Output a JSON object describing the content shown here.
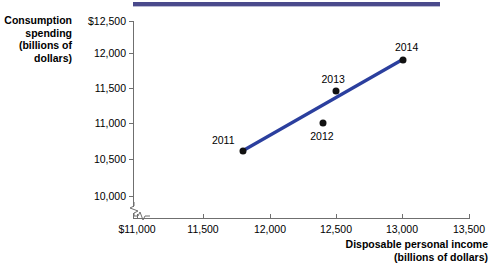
{
  "chart_data": {
    "type": "scatter",
    "title": "",
    "xlabel": "Disposable personal income (billions of dollars)",
    "ylabel": "Consumption spending (billions of dollars)",
    "xlim": [
      11000,
      13500
    ],
    "ylim": [
      10000,
      12500
    ],
    "grid": false,
    "legend": null,
    "axis_break_x": true,
    "axis_break_y": true,
    "x_ticks": [
      "$11,000",
      "11,500",
      "12,000",
      "12,500",
      "13,000",
      "13,500"
    ],
    "x_tick_values": [
      11000,
      11500,
      12000,
      12500,
      13000,
      13500
    ],
    "y_ticks": [
      "$12,500",
      "12,000",
      "11,500",
      "11,000",
      "10,500",
      "10,000"
    ],
    "y_tick_values": [
      12500,
      12000,
      11500,
      11000,
      10500,
      10000
    ],
    "points": [
      {
        "label": "2011",
        "x": 11800,
        "y": 10650
      },
      {
        "label": "2012",
        "x": 12400,
        "y": 11050
      },
      {
        "label": "2013",
        "x": 12500,
        "y": 11500
      },
      {
        "label": "2014",
        "x": 13000,
        "y": 11950
      }
    ],
    "trend_line": {
      "from": {
        "x": 11800,
        "y": 10650
      },
      "to": {
        "x": 13000,
        "y": 11950
      },
      "color": "#2b3f9e"
    },
    "marker_color": "#111111"
  },
  "axes": {
    "y_title_lines": [
      "Consumption",
      "spending",
      "(billions of",
      "dollars)"
    ],
    "x_title_lines": [
      "Disposable personal income",
      "(billions of dollars)"
    ]
  },
  "decor": {
    "top_rule_color": "#4a4a8c"
  }
}
